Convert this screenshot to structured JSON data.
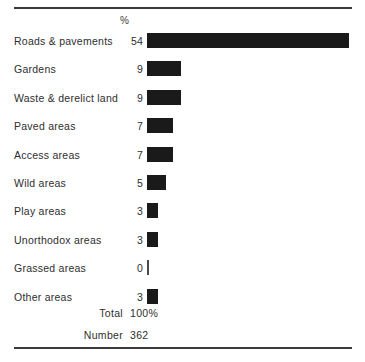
{
  "chart_data": {
    "type": "bar",
    "orientation": "horizontal",
    "title": "",
    "xlabel": "",
    "ylabel": "",
    "value_header": "%",
    "xlim": [
      0,
      54
    ],
    "grid": false,
    "legend": null,
    "categories": [
      "Roads & pavements",
      "Gardens",
      "Waste & derelict land",
      "Paved areas",
      "Access areas",
      "Wild areas",
      "Play areas",
      "Unorthodox areas",
      "Grassed areas",
      "Other areas"
    ],
    "values": [
      54,
      9,
      9,
      7,
      7,
      5,
      3,
      3,
      0,
      3
    ],
    "value_labels": [
      "54",
      "9",
      "9",
      "7",
      "7",
      "5",
      "3",
      "3",
      "0",
      "3"
    ],
    "bar_color": "#1a1a1a",
    "annotations": {
      "total_label": "Total",
      "total_value": "100%",
      "number_label": "Number",
      "number_value": "362"
    }
  }
}
